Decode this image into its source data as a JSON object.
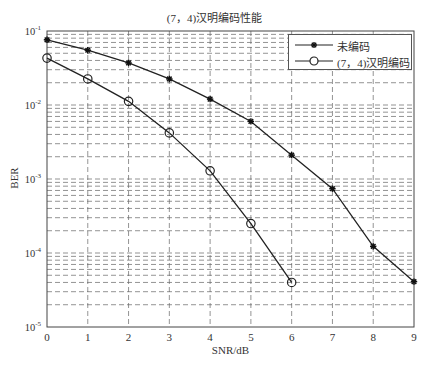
{
  "chart_data": {
    "type": "line",
    "title": "(7，4)汉明编码性能",
    "xlabel": "SNR/dB",
    "ylabel": "BER",
    "yscale": "log",
    "xlim": [
      0,
      9
    ],
    "ylim": [
      1e-05,
      0.1
    ],
    "grid": true,
    "legend_position": "upper right",
    "x_ticks": [
      "0",
      "1",
      "2",
      "3",
      "4",
      "5",
      "6",
      "7",
      "8",
      "9"
    ],
    "y_ticks": [
      {
        "base": "10",
        "exp": "-1",
        "value": 0.1
      },
      {
        "base": "10",
        "exp": "-2",
        "value": 0.01
      },
      {
        "base": "10",
        "exp": "-3",
        "value": 0.001
      },
      {
        "base": "10",
        "exp": "-4",
        "value": 0.0001
      },
      {
        "base": "10",
        "exp": "-5",
        "value": 1e-05
      }
    ],
    "series": [
      {
        "name": "未编码",
        "marker": "star",
        "x": [
          0,
          1,
          2,
          3,
          4,
          5,
          6,
          7,
          8,
          9
        ],
        "values": [
          0.076,
          0.055,
          0.037,
          0.0225,
          0.012,
          0.006,
          0.0021,
          0.00074,
          0.000123,
          4.1e-05
        ]
      },
      {
        "name": "(7，4)汉明编码",
        "marker": "circle",
        "x": [
          0,
          1,
          2,
          3,
          4,
          5,
          6
        ],
        "values": [
          0.043,
          0.0225,
          0.0112,
          0.0042,
          0.00129,
          0.00025,
          4e-05
        ]
      }
    ]
  },
  "legend": {
    "items": [
      {
        "label": "未编码"
      },
      {
        "label": "(7，4)汉明编码"
      }
    ]
  },
  "colors": {
    "line": "#222222",
    "grid": "#666666",
    "axis": "#444444"
  }
}
